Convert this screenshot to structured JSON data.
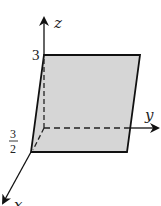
{
  "diagram": {
    "type": "3d-coordinate-plane",
    "axes": {
      "x": {
        "label": "x"
      },
      "y": {
        "label": "y"
      },
      "z": {
        "label": "z"
      }
    },
    "tick_labels": {
      "z_mark": "3",
      "x_mark_num": "3",
      "x_mark_den": "2"
    },
    "shaded_region": {
      "description": "plane segment",
      "fill": "#d6d6d6",
      "stroke": "#111111"
    }
  }
}
